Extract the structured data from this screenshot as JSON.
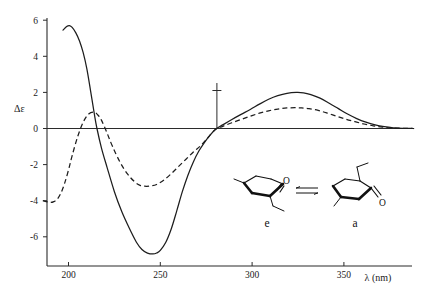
{
  "chart_data": {
    "type": "line",
    "title": "",
    "subtitle": "",
    "xlabel": "λ  (nm)",
    "ylabel": "Δε",
    "xlim": [
      186,
      392
    ],
    "ylim": [
      -7.6,
      6.2
    ],
    "grid": false,
    "legend_position": "none",
    "x_ticks": [
      200,
      250,
      300,
      350
    ],
    "x_tick_labels": [
      "200",
      "250",
      "300",
      "350"
    ],
    "y_ticks": [
      6,
      4,
      2,
      0,
      -2,
      -4,
      -6
    ],
    "y_tick_labels": [
      "6",
      "4",
      "2",
      "0",
      "-2",
      "-4",
      "-6"
    ],
    "zero_line": true,
    "series": [
      {
        "name": "solid-curve",
        "style": "solid",
        "x": [
          197,
          199,
          200.5,
          202,
          204,
          206,
          208,
          210,
          212,
          214,
          215.5,
          218,
          221,
          225,
          229,
          233,
          237,
          240,
          243,
          246,
          248,
          250,
          253,
          256,
          259,
          262,
          265,
          268,
          271,
          274,
          277,
          280,
          284,
          289,
          294,
          299,
          304,
          309,
          314,
          319,
          324,
          328,
          332,
          337,
          342,
          347,
          352,
          357,
          362,
          367,
          372,
          377,
          382,
          388
        ],
        "y": [
          5.45,
          5.65,
          5.7,
          5.6,
          5.3,
          4.85,
          4.2,
          3.3,
          2.1,
          0.85,
          0.0,
          -1.1,
          -2.15,
          -3.5,
          -4.6,
          -5.5,
          -6.3,
          -6.7,
          -6.9,
          -6.95,
          -6.9,
          -6.75,
          -6.3,
          -5.55,
          -4.55,
          -3.5,
          -2.6,
          -1.85,
          -1.25,
          -0.78,
          -0.38,
          -0.05,
          0.2,
          0.5,
          0.78,
          1.05,
          1.35,
          1.62,
          1.82,
          1.95,
          2.0,
          1.98,
          1.88,
          1.68,
          1.4,
          1.1,
          0.8,
          0.55,
          0.35,
          0.2,
          0.1,
          0.04,
          0.01,
          0.0
        ]
      },
      {
        "name": "dashed-curve",
        "style": "dashed",
        "x": [
          186,
          188,
          190,
          192,
          194,
          196,
          198,
          200,
          202,
          205,
          208,
          211,
          214,
          216,
          218,
          221,
          224,
          228,
          232,
          236,
          239,
          242,
          245,
          248,
          252,
          256,
          260,
          264,
          268,
          272,
          276,
          280,
          284,
          289,
          294,
          299,
          304,
          309,
          314,
          319,
          324,
          327,
          331,
          336,
          341,
          346,
          351,
          356,
          361,
          366,
          371,
          376,
          382,
          388
        ],
        "y": [
          -4.0,
          -4.05,
          -4.1,
          -4.05,
          -3.9,
          -3.55,
          -3.0,
          -2.3,
          -1.5,
          -0.45,
          0.35,
          0.8,
          0.9,
          0.75,
          0.45,
          -0.25,
          -1.0,
          -1.85,
          -2.5,
          -2.95,
          -3.15,
          -3.2,
          -3.18,
          -3.1,
          -2.85,
          -2.5,
          -2.1,
          -1.7,
          -1.3,
          -0.95,
          -0.5,
          -0.05,
          0.12,
          0.32,
          0.5,
          0.68,
          0.85,
          0.98,
          1.08,
          1.14,
          1.15,
          1.14,
          1.1,
          1.0,
          0.85,
          0.68,
          0.52,
          0.38,
          0.25,
          0.15,
          0.08,
          0.03,
          0.01,
          0.0
        ]
      }
    ],
    "annotations": [
      {
        "name": "zero-crossing-marker",
        "x": 280,
        "label": ""
      }
    ]
  },
  "insets": {
    "equilibrium_symbol": "⇌",
    "left_structure": {
      "name": "equatorial-conformer",
      "label": "e",
      "atom_label": "O"
    },
    "right_structure": {
      "name": "axial-conformer",
      "label": "a",
      "atom_label": "O"
    }
  },
  "axes": {
    "y_axis_title": "Δε",
    "x_axis_title": "λ  (nm)",
    "x_unit": "(nm)",
    "x_symbol": "λ"
  }
}
